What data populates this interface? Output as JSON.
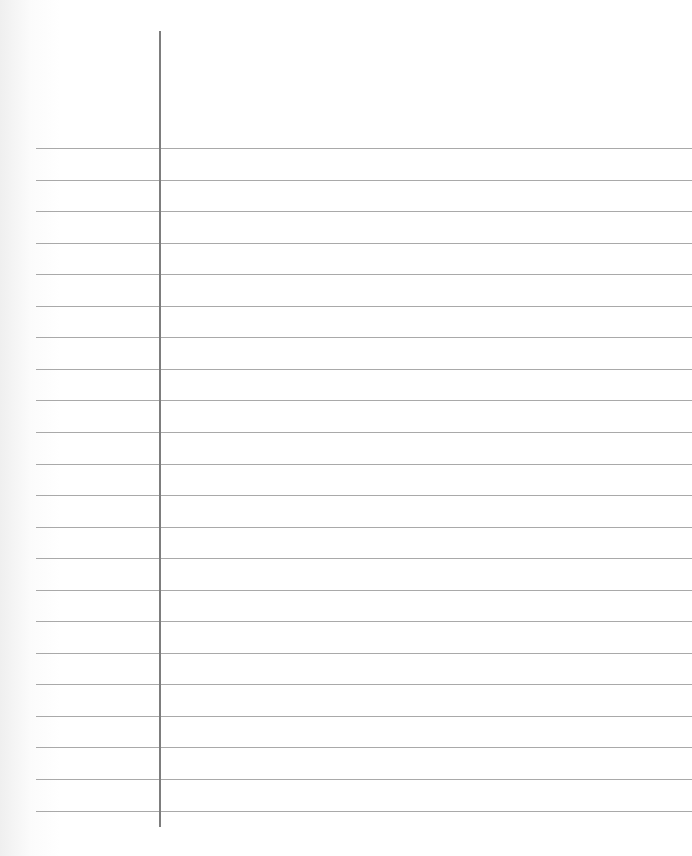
{
  "paper": {
    "type": "lined-notebook-paper",
    "colors": {
      "background": "#ffffff",
      "rule_line": "#a9a9a9",
      "margin_line": "#7d7d7d"
    },
    "margin_line": {
      "x": 159,
      "top": 31,
      "bottom": 827
    },
    "rules": {
      "count": 22,
      "first_y": 148,
      "spacing": 31.55,
      "left": 36,
      "right": 692
    }
  }
}
